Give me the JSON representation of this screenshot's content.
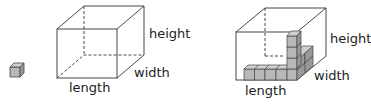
{
  "diagram": {
    "left": {
      "labels": {
        "height": "height",
        "width": "width",
        "length": "length"
      }
    },
    "right": {
      "labels": {
        "height": "height",
        "width": "width",
        "length": "length"
      }
    },
    "colors": {
      "cube_fill": "#b8b8b8",
      "cube_top": "#d0d0d0",
      "cube_side": "#9a9a9a",
      "line": "#333333"
    }
  }
}
